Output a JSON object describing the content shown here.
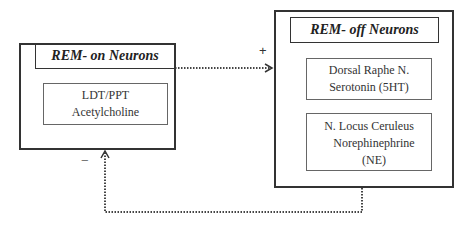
{
  "rem_on": {
    "title": "REM- on Neurons",
    "nucleus": {
      "line1": "LDT/PPT",
      "line2": "Acetylcholine"
    }
  },
  "rem_off": {
    "title": "REM- off Neurons",
    "nuclei": [
      {
        "line1": "Dorsal Raphe N.",
        "line2": "Serotonin (5HT)",
        "line3": ""
      },
      {
        "line1": "N. Locus Ceruleus",
        "line2": "Norephinephrine",
        "line3": "(NE)"
      }
    ]
  },
  "arrows": {
    "excitatory_sign": "+",
    "inhibitory_sign": "−"
  },
  "colors": {
    "line": "#333333",
    "inner_border": "#666666"
  }
}
